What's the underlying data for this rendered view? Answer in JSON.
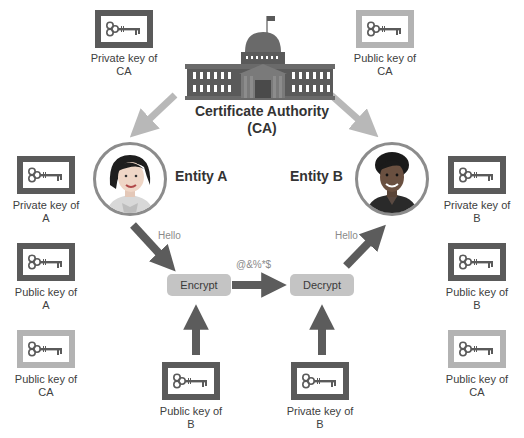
{
  "diagram": {
    "authority": {
      "label_line1": "Certificate Authority",
      "label_line2": "(CA)",
      "icon": "government-building-icon"
    },
    "entities": [
      {
        "id": "A",
        "label": "Entity A",
        "icon": "woman-avatar"
      },
      {
        "id": "B",
        "label": "Entity B",
        "icon": "woman-avatar"
      }
    ],
    "keys": {
      "top_left": {
        "line1": "Private key of",
        "line2": "CA",
        "style": "dark"
      },
      "top_right": {
        "line1": "Public key of",
        "line2": "CA",
        "style": "light"
      },
      "left_1": {
        "line1": "Private key of",
        "line2": "A",
        "style": "dark"
      },
      "left_2": {
        "line1": "Public key of",
        "line2": "A",
        "style": "dark"
      },
      "left_3": {
        "line1": "Public key of",
        "line2": "CA",
        "style": "light"
      },
      "right_1": {
        "line1": "Private key of",
        "line2": "B",
        "style": "dark"
      },
      "right_2": {
        "line1": "Public key of",
        "line2": "B",
        "style": "dark"
      },
      "right_3": {
        "line1": "Public key of",
        "line2": "CA",
        "style": "light"
      },
      "bottom_encrypt": {
        "line1": "Public key of",
        "line2": "B",
        "style": "dark"
      },
      "bottom_decrypt": {
        "line1": "Private key of",
        "line2": "B",
        "style": "dark"
      }
    },
    "operations": {
      "encrypt": "Encrypt",
      "decrypt": "Decrypt"
    },
    "messages": {
      "plaintext_a": "Hello",
      "ciphertext": "@&%*$",
      "plaintext_b": "Hello"
    },
    "colors": {
      "dark_border": "#5a5a5a",
      "light_border": "#b3b3b3",
      "arrow_dark": "#5c5c5c",
      "arrow_light": "#b8b8b8",
      "op_fill": "#c4c4c4"
    }
  }
}
